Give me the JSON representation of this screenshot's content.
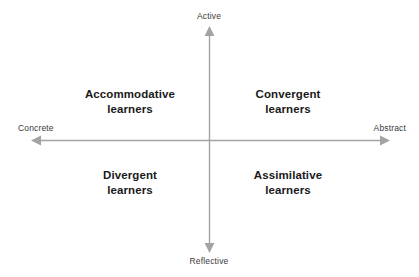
{
  "diagram": {
    "axes": {
      "vertical": {
        "top_label": "Active",
        "bottom_label": "Reflective"
      },
      "horizontal": {
        "left_label": "Concrete",
        "right_label": "Abstract"
      },
      "line_color": "#a3a3a3",
      "arrow_color": "#a3a3a3"
    },
    "quadrants": [
      {
        "id": "top-left",
        "line1": "Accommodative",
        "line2": "learners"
      },
      {
        "id": "top-right",
        "line1": "Convergent",
        "line2": "learners"
      },
      {
        "id": "bottom-left",
        "line1": "Divergent",
        "line2": "learners"
      },
      {
        "id": "bottom-right",
        "line1": "Assimilative",
        "line2": "learners"
      }
    ],
    "text_color": "#1a1a1a",
    "axis_label_color": "#3a3a3a",
    "background_color": "#ffffff"
  }
}
